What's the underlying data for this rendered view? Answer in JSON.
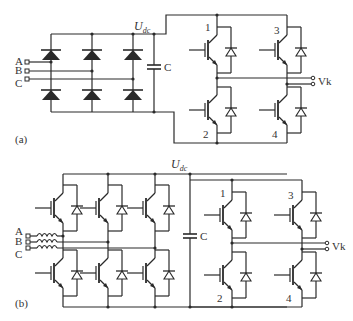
{
  "figure": {
    "panel_a": {
      "label": "(a)",
      "inputs": [
        "A",
        "B",
        "C"
      ],
      "dc_voltage_label": "U",
      "dc_voltage_sub": "dc",
      "capacitor_label": "C",
      "switch_labels": [
        "1",
        "2",
        "3",
        "4"
      ],
      "output_label": "Vk",
      "rectifier": "diode bridge (6 diodes)"
    },
    "panel_b": {
      "label": "(b)",
      "inputs": [
        "A",
        "B",
        "C"
      ],
      "dc_voltage_label": "U",
      "dc_voltage_sub": "dc",
      "capacitor_label": "C",
      "switch_labels": [
        "1",
        "2",
        "3",
        "4"
      ],
      "output_label": "Vk",
      "rectifier": "active IGBT bridge (6 IGBTs with inductors)"
    }
  },
  "colors": {
    "line": "#2a2a2a",
    "text": "#333333",
    "background": "#ffffff"
  }
}
